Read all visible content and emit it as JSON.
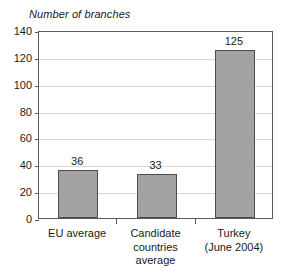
{
  "chart_data": {
    "type": "bar",
    "title": "Number of branches",
    "xlabel": "",
    "ylabel": "",
    "ylim": [
      0,
      140
    ],
    "ytick_step": 20,
    "yticks": [
      0,
      20,
      40,
      60,
      80,
      100,
      120,
      140
    ],
    "grid": true,
    "legend": "none",
    "categories": [
      "EU average",
      "Candidate\ncountries\naverage",
      "Turkey\n(June 2004)"
    ],
    "values": [
      36,
      33,
      125
    ],
    "value_labels": [
      "36",
      "33",
      "125"
    ],
    "colors": {
      "bar_fill": "#a2a2a2",
      "bar_border": "#4c4c4c",
      "axis": "#59595c",
      "gridline": "#d8d8d8",
      "text": "#1a1a1a",
      "background": "#ffffff"
    }
  }
}
